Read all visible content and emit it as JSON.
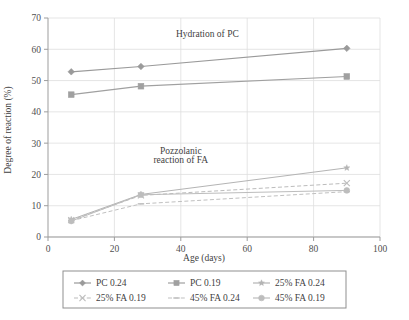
{
  "chart_data": {
    "type": "line",
    "title": "",
    "xlabel": "Age (days)",
    "ylabel": "Degree of reaction (%)",
    "xlim": [
      0,
      100
    ],
    "ylim": [
      0,
      70
    ],
    "xticks": [
      "0",
      "20",
      "40",
      "60",
      "80",
      "100"
    ],
    "yticks": [
      "0",
      "10",
      "20",
      "30",
      "40",
      "50",
      "60",
      "70"
    ],
    "grid": "both",
    "legend_position": "bottom",
    "x": [
      7,
      28,
      90
    ],
    "series": [
      {
        "name": "PC 0.24",
        "values": [
          52.8,
          54.5,
          60.3
        ],
        "marker": "diamond",
        "dash": "solid",
        "color": "#9a9a9a"
      },
      {
        "name": "PC 0.19",
        "values": [
          45.5,
          48.2,
          51.3
        ],
        "marker": "square",
        "dash": "solid",
        "color": "#a0a0a0"
      },
      {
        "name": "25% FA 0.24",
        "values": [
          5.6,
          13.6,
          22.1
        ],
        "marker": "star",
        "dash": "solid",
        "color": "#b4b4b4"
      },
      {
        "name": "25% FA 0.19",
        "values": [
          5.4,
          13.3,
          17.2
        ],
        "marker": "cross",
        "dash": "dashed",
        "color": "#bcbcbc"
      },
      {
        "name": "45% FA 0.24",
        "values": [
          5.2,
          10.6,
          14.5
        ],
        "marker": "dash",
        "dash": "dashed",
        "color": "#c0c0c0"
      },
      {
        "name": "45% FA 0.19",
        "values": [
          5.1,
          13.5,
          14.9
        ],
        "marker": "circle",
        "dash": "solid",
        "color": "#bdbdbd"
      }
    ],
    "annotations": [
      {
        "text": "Hydration of PC",
        "x": 48,
        "y": 64
      },
      {
        "text": "Pozzolanic",
        "x": 40,
        "y": 26.5
      },
      {
        "text": "reaction of FA",
        "x": 40,
        "y": 23.5
      }
    ]
  },
  "legend": {
    "items": [
      {
        "label": "PC 0.24"
      },
      {
        "label": "PC 0.19"
      },
      {
        "label": "25% FA 0.24"
      },
      {
        "label": "25% FA 0.19"
      },
      {
        "label": "45% FA 0.24"
      },
      {
        "label": "45% FA 0.19"
      }
    ]
  },
  "colors": {
    "axis": "#9d9d9d",
    "grid": "#dedede",
    "text": "#3f3f3f",
    "legend_border": "#8f8f8f"
  }
}
